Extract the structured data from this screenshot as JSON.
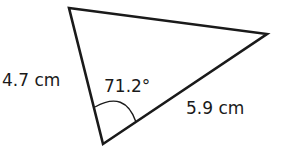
{
  "diagram": {
    "shape": "triangle",
    "side_left": "4.7 cm",
    "side_bottom_right": "5.9 cm",
    "included_angle": "71.2°",
    "stroke_color": "#1a1a1a"
  }
}
